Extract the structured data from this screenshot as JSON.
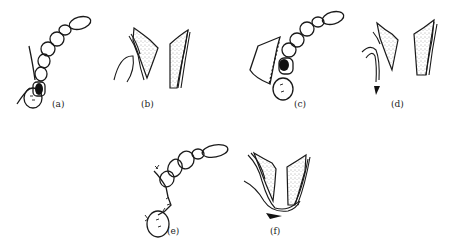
{
  "figure": {
    "panels": [
      {
        "id": "a",
        "label": "(a)"
      },
      {
        "id": "b",
        "label": "(b)"
      },
      {
        "id": "c",
        "label": "(c)"
      },
      {
        "id": "d",
        "label": "(d)"
      },
      {
        "id": "e",
        "label": "(e)"
      },
      {
        "id": "f",
        "label": "(f)"
      }
    ],
    "colors": {
      "background": "#ffffff",
      "ink": "#1a1a1a",
      "stipple": "#555555"
    }
  }
}
